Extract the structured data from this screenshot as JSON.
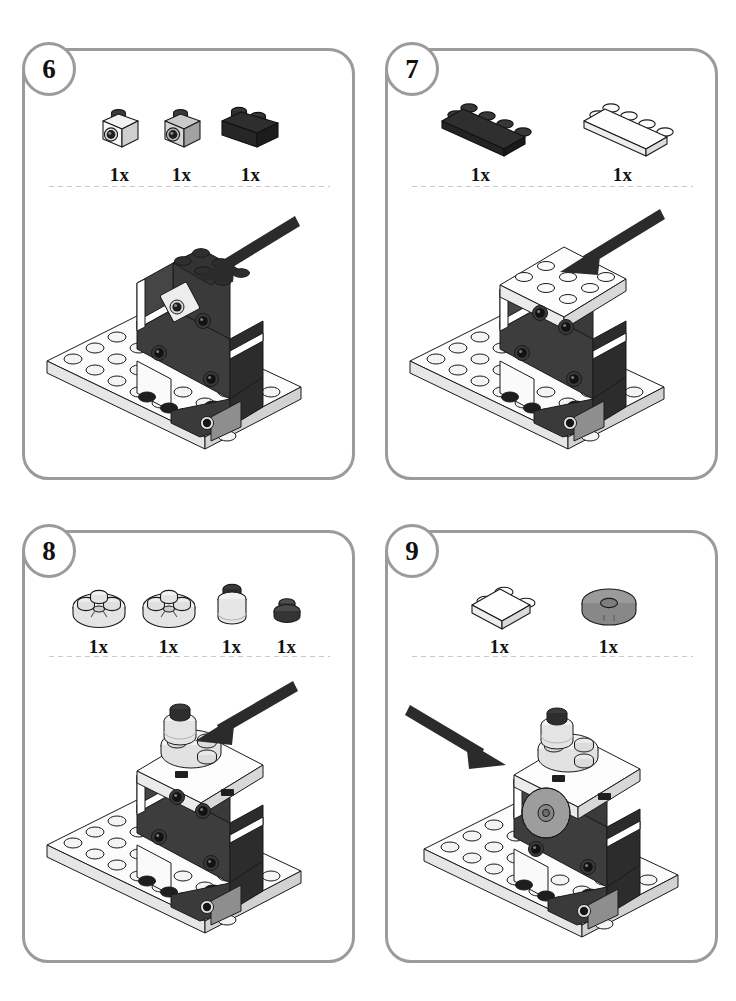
{
  "document": {
    "type": "lego-instruction-page",
    "steps_visible": [
      6,
      7,
      8,
      9
    ]
  },
  "colors": {
    "panel_border": "#9b9b9b",
    "badge_border": "#9b9b9b",
    "dotted_separator": "#c9c9c9",
    "brick_dark": "#3a3a3a",
    "brick_black": "#262626",
    "brick_white": "#ffffff",
    "brick_light_gray": "#c8c8c8",
    "brick_mid_gray": "#8d8d8d",
    "outline": "#1a1a1a",
    "arrow": "#2b2b2b",
    "text": "#111111"
  },
  "steps": [
    {
      "number": "6",
      "parts": [
        {
          "name": "headlight-brick-white",
          "qty": "1x",
          "color": "#ffffff",
          "shape": "headlight-1x1"
        },
        {
          "name": "headlight-brick-gray",
          "qty": "1x",
          "color": "#b5b5b5",
          "shape": "headlight-1x1"
        },
        {
          "name": "brick-1x2-black",
          "qty": "1x",
          "color": "#2a2a2a",
          "shape": "brick-1x2"
        }
      ],
      "arrow": {
        "direction": "down-left",
        "target": "top-of-model"
      },
      "model": "assembly-step-6"
    },
    {
      "number": "7",
      "parts": [
        {
          "name": "plate-2x4-black",
          "qty": "1x",
          "color": "#2a2a2a",
          "shape": "plate-2x4"
        },
        {
          "name": "plate-2x4-white",
          "qty": "1x",
          "color": "#ffffff",
          "shape": "plate-2x4"
        }
      ],
      "arrow": {
        "direction": "down-left",
        "target": "top-of-model"
      },
      "model": "assembly-step-7"
    },
    {
      "number": "8",
      "parts": [
        {
          "name": "round-plate-2x2-white-a",
          "qty": "1x",
          "color": "#efefef",
          "shape": "round-plate-2x2"
        },
        {
          "name": "round-plate-2x2-white-b",
          "qty": "1x",
          "color": "#efefef",
          "shape": "round-plate-2x2"
        },
        {
          "name": "round-brick-1x1-white",
          "qty": "1x",
          "color": "#ededed",
          "shape": "round-brick-1x1"
        },
        {
          "name": "round-plate-1x1-dark",
          "qty": "1x",
          "color": "#4a4a4a",
          "shape": "round-plate-1x1"
        }
      ],
      "arrow": {
        "direction": "down-left",
        "target": "top-of-model"
      },
      "model": "assembly-step-8"
    },
    {
      "number": "9",
      "parts": [
        {
          "name": "plate-2x2-white",
          "qty": "1x",
          "color": "#ffffff",
          "shape": "plate-2x2"
        },
        {
          "name": "round-tile-2x2-gray",
          "qty": "1x",
          "color": "#9a9a9a",
          "shape": "round-tile-2x2"
        }
      ],
      "arrow": {
        "direction": "down-right",
        "target": "left-side-of-model"
      },
      "model": "assembly-step-9"
    }
  ]
}
